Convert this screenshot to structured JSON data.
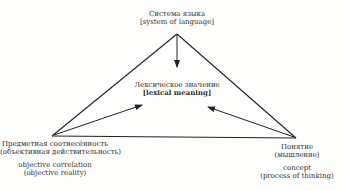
{
  "diagram": {
    "type": "semantic-triangle",
    "apex": {
      "label_ru": "Система языка",
      "label_en": "[system of language]"
    },
    "center": {
      "label_ru": "Лексическое значение",
      "label_en": "[lexical meaning]"
    },
    "bottom_left": {
      "label_ru_1": "Предметная соотнесённость",
      "label_ru_2": "(объективная действительность)",
      "label_en_1": "objective correlation",
      "label_en_2": "(objective reality)"
    },
    "bottom_right": {
      "label_ru_1": "Понятие",
      "label_ru_2": "(мышление)",
      "label_en_1": "concept",
      "label_en_2": "(process of thinking)"
    },
    "edges": [
      {
        "from": "apex",
        "to": "bottom_left",
        "style": "line"
      },
      {
        "from": "apex",
        "to": "bottom_right",
        "style": "line"
      },
      {
        "from": "bottom_left",
        "to": "bottom_right",
        "style": "line"
      },
      {
        "from": "apex",
        "to": "center",
        "style": "arrow"
      },
      {
        "from": "bottom_left",
        "to": "center",
        "style": "arrow"
      },
      {
        "from": "bottom_right",
        "to": "center",
        "style": "arrow"
      }
    ],
    "colors": {
      "line": "#222222",
      "background": "#fdfdfb"
    }
  }
}
